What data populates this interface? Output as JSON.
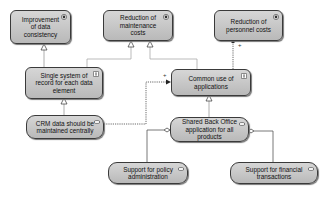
{
  "diagram": {
    "goals": [
      {
        "id": "g1",
        "label": "Improvement of data consistency",
        "type": "goal"
      },
      {
        "id": "g2",
        "label": "Reduction of maintenance costs",
        "type": "goal"
      },
      {
        "id": "g3",
        "label": "Reduction of personnel costs",
        "type": "goal"
      }
    ],
    "principles": [
      {
        "id": "p1",
        "label": "Single system of record for each data element",
        "type": "principle"
      },
      {
        "id": "p2",
        "label": "Common use of applications",
        "type": "principle"
      }
    ],
    "components": [
      {
        "id": "c1",
        "label": "CRM data should be maintained centrally",
        "type": "application-component"
      },
      {
        "id": "c2",
        "label": "Shared Back Office application for all products",
        "type": "application-component"
      }
    ],
    "services": [
      {
        "id": "s1",
        "label": "Support for policy administration",
        "type": "application-component"
      },
      {
        "id": "s2",
        "label": "Support for financial transactions",
        "type": "application-component"
      }
    ],
    "edges": [
      {
        "from": "p1",
        "to": "g1",
        "type": "realization"
      },
      {
        "from": "p1",
        "to": "g2",
        "type": "realization"
      },
      {
        "from": "p2",
        "to": "g2",
        "type": "realization"
      },
      {
        "from": "p2",
        "to": "g3",
        "type": "influence",
        "label": "+"
      },
      {
        "from": "c1",
        "to": "p1",
        "type": "realization"
      },
      {
        "from": "c1",
        "to": "p2",
        "type": "influence",
        "label": "+"
      },
      {
        "from": "c2",
        "to": "p2",
        "type": "realization"
      },
      {
        "from": "s1",
        "to": "c2",
        "type": "aggregation"
      },
      {
        "from": "s2",
        "to": "c2",
        "type": "aggregation"
      }
    ],
    "edge_labels": {
      "plus1": "+",
      "plus2": "+"
    }
  }
}
